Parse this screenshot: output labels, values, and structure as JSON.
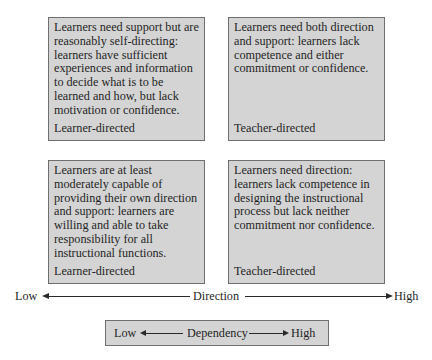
{
  "quadrants": {
    "top_left": {
      "description": "Learners need support but are reasonably self-directing: learners have sufficient experiences and information to decide what is to be learned and how, but lack motivation or confidence.",
      "label": "Learner-directed"
    },
    "top_right": {
      "description": "Learners need both direction and support: learners lack competence and either commitment or confidence.",
      "label": "Teacher-directed"
    },
    "bottom_left": {
      "description": "Learners are at least moderately capable of providing their own direction and support: learners are willing and able to take responsibility for all instructional functions.",
      "label": "Learner-directed"
    },
    "bottom_right": {
      "description": "Learners need direction: learners lack competence in designing the instructional process but lack neither commitment nor confidence.",
      "label": "Teacher-directed"
    }
  },
  "direction_axis": {
    "low": "Low",
    "label": "Direction",
    "high": "High"
  },
  "dependency_axis": {
    "low": "Low",
    "label": "Dependency",
    "high": "High"
  },
  "colors": {
    "box_fill": "#d4d4d4",
    "box_border": "#6f6f6f",
    "text": "#1f1f1f",
    "arrow": "#2a2a2a"
  }
}
